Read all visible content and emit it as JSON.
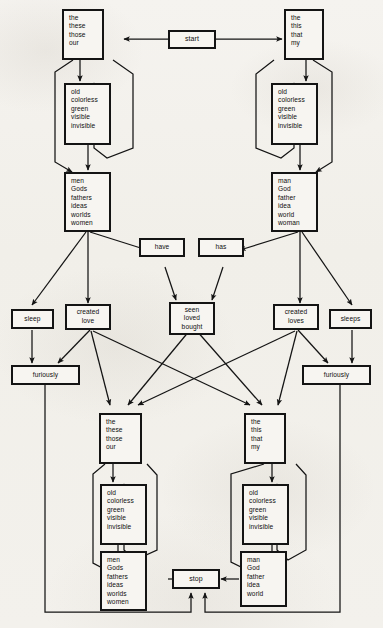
{
  "figure": {
    "type": "finite-state-network-diagram",
    "ink_color": "#141414",
    "paper_color": "#f3f1ec"
  },
  "nodes": {
    "start": {
      "label": "start",
      "words": [
        "start"
      ]
    },
    "stop": {
      "label": "stop",
      "words": [
        "stop"
      ]
    },
    "det_left_top": {
      "label": "determiners-plural-top",
      "words": [
        "the",
        "these",
        "those",
        "our"
      ]
    },
    "det_right_top": {
      "label": "determiners-singular-top",
      "words": [
        "the",
        "this",
        "that",
        "my"
      ]
    },
    "adj_left_top": {
      "label": "adjectives-left-top",
      "words": [
        "old",
        "colorless",
        "green",
        "visible",
        "invisible"
      ]
    },
    "adj_right_top": {
      "label": "adjectives-right-top",
      "words": [
        "old",
        "colorless",
        "green",
        "visible",
        "invisible"
      ]
    },
    "noun_left_top": {
      "label": "nouns-plural-top",
      "words": [
        "men",
        "Gods",
        "fathers",
        "ideas",
        "worlds",
        "women"
      ]
    },
    "noun_right_top": {
      "label": "nouns-singular-top",
      "words": [
        "man",
        "God",
        "father",
        "idea",
        "world",
        "woman"
      ]
    },
    "have": {
      "label": "auxiliary-plural",
      "words": [
        "have"
      ]
    },
    "has": {
      "label": "auxiliary-singular",
      "words": [
        "has"
      ]
    },
    "participles": {
      "label": "past-participles",
      "words": [
        "seen",
        "loved",
        "bought"
      ]
    },
    "sleep": {
      "label": "intransitive-verb-plural",
      "words": [
        "sleep"
      ]
    },
    "created_love": {
      "label": "transitive-verbs-plural",
      "words": [
        "created",
        "love"
      ]
    },
    "created_loves": {
      "label": "transitive-verbs-singular",
      "words": [
        "created",
        "loves"
      ]
    },
    "sleeps": {
      "label": "intransitive-verb-singular",
      "words": [
        "sleeps"
      ]
    },
    "furiously_left": {
      "label": "adverb-left",
      "words": [
        "furiously"
      ]
    },
    "furiously_right": {
      "label": "adverb-right",
      "words": [
        "furiously"
      ]
    },
    "det_left_bottom": {
      "label": "determiners-plural-bottom",
      "words": [
        "the",
        "these",
        "those",
        "our"
      ]
    },
    "det_right_bottom": {
      "label": "determiners-singular-bottom",
      "words": [
        "the",
        "this",
        "that",
        "my"
      ]
    },
    "adj_left_bottom": {
      "label": "adjectives-left-bottom",
      "words": [
        "old",
        "colorless",
        "green",
        "visible",
        "invisible"
      ]
    },
    "adj_right_bottom": {
      "label": "adjectives-right-bottom",
      "words": [
        "old",
        "colorless",
        "green",
        "visible",
        "invisible"
      ]
    },
    "noun_left_bottom": {
      "label": "nouns-plural-bottom",
      "words": [
        "men",
        "Gods",
        "fathers",
        "ideas",
        "worlds",
        "women"
      ]
    },
    "noun_right_bottom": {
      "label": "nouns-singular-bottom",
      "words": [
        "man",
        "God",
        "father",
        "idea",
        "world"
      ]
    }
  }
}
